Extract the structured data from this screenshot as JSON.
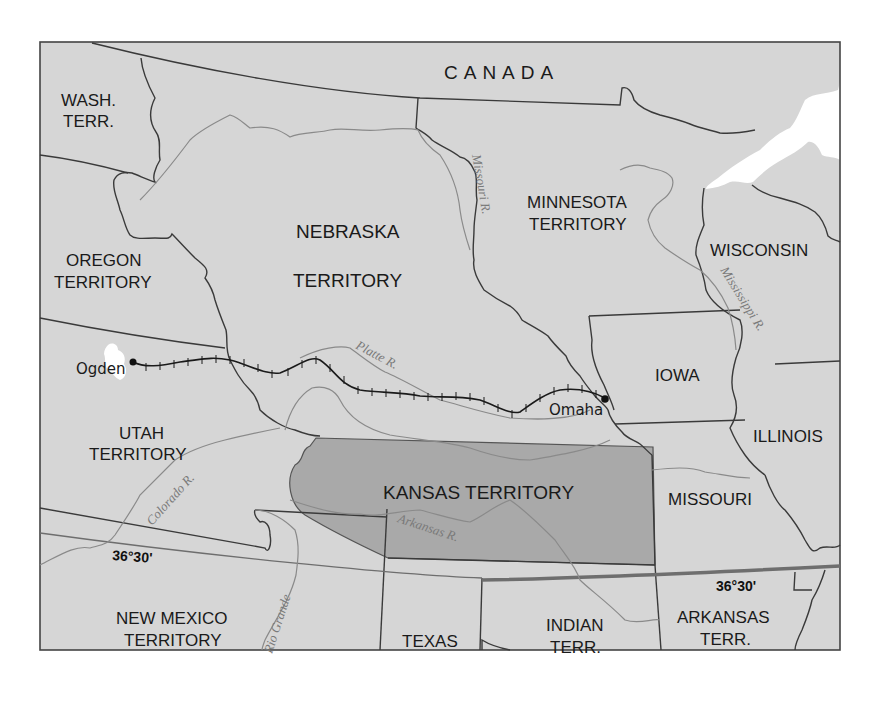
{
  "map": {
    "colors": {
      "land": "#d6d6d6",
      "kansas_fill": "#a9a9a9",
      "border": "#3a3a3a",
      "river": "#8a8a8a",
      "water": "#ffffff",
      "parallel_line": "#6e6e6e",
      "railroad": "#1a1a1a",
      "frame": "#444444"
    },
    "regions": {
      "canada": "CANADA",
      "wash_line1": "WASH.",
      "wash_line2": "TERR.",
      "oregon_line1": "OREGON",
      "oregon_line2": "TERRITORY",
      "nebraska_line1": "NEBRASKA",
      "nebraska_line2": "TERRITORY",
      "minnesota_line1": "MINNESOTA",
      "minnesota_line2": "TERRITORY",
      "wisconsin": "WISCONSIN",
      "iowa": "IOWA",
      "illinois": "ILLINOIS",
      "utah_line1": "UTAH",
      "utah_line2": "TERRITORY",
      "kansas": "KANSAS TERRITORY",
      "missouri": "MISSOURI",
      "new_mexico_line1": "NEW MEXICO",
      "new_mexico_line2": "TERRITORY",
      "texas": "TEXAS",
      "indian_line1": "INDIAN",
      "indian_line2": "TERR.",
      "arkansas_line1": "ARKANSAS",
      "arkansas_line2": "TERR."
    },
    "rivers": {
      "missouri": "Missouri R.",
      "mississippi": "Mississippi R.",
      "platte": "Platte R.",
      "colorado": "Colorado R.",
      "arkansas": "Arkansas R.",
      "rio_grande": "Rio Grande"
    },
    "cities": {
      "ogden": "Ogden",
      "omaha": "Omaha"
    },
    "parallel": {
      "label_west": "36°30'",
      "label_east": "36°30'"
    }
  }
}
